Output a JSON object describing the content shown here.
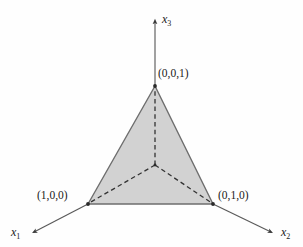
{
  "figure": {
    "name": "probability-simplex-diagram",
    "background_color": "#fefefe"
  },
  "axes": [
    {
      "id": "x1",
      "label": "x",
      "subscript": "1",
      "from": [
        88,
        204
      ],
      "to": [
        33,
        233
      ],
      "arrow": "end",
      "color": "#555555"
    },
    {
      "id": "x2",
      "label": "x",
      "subscript": "2",
      "from": [
        213,
        204
      ],
      "to": [
        272,
        233
      ],
      "arrow": "end",
      "color": "#555555"
    },
    {
      "id": "x3",
      "label": "x",
      "subscript": "3",
      "from": [
        155,
        86
      ],
      "to": [
        155,
        20
      ],
      "arrow": "end",
      "color": "#555555"
    }
  ],
  "vertices": [
    {
      "id": "v001",
      "label": "(0,0,1)",
      "point": [
        155,
        86
      ]
    },
    {
      "id": "v100",
      "label": "(1,0,0)",
      "point": [
        88,
        204
      ]
    },
    {
      "id": "v010",
      "label": "(0,1,0)",
      "point": [
        213,
        204
      ]
    }
  ],
  "origin": {
    "id": "origin",
    "point": [
      155,
      165
    ]
  },
  "triangle": {
    "points": "155,86 88,204 213,204",
    "fill": "#d2d2d2",
    "stroke": "#6e6e6e",
    "stroke_width": 1.4
  },
  "dashed_lines": [
    {
      "id": "origin-to-v001",
      "from": [
        155,
        165
      ],
      "to": [
        155,
        88
      ]
    },
    {
      "id": "origin-to-v100",
      "from": [
        155,
        165
      ],
      "to": [
        90,
        203
      ]
    },
    {
      "id": "origin-to-v010",
      "from": [
        155,
        165
      ],
      "to": [
        211,
        203
      ]
    }
  ],
  "colors": {
    "triangle_fill": "#d2d2d2",
    "triangle_stroke": "#6e6e6e",
    "axis": "#555555",
    "dashed": "#333333",
    "text": "#1a1a1a"
  }
}
